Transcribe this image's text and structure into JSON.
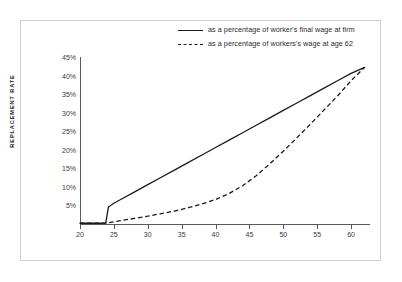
{
  "figure": {
    "background_color": "#ffffff",
    "frame_color": "#cfcfcf",
    "line_color": "#1a1a1a"
  },
  "axis": {
    "y_title": "REPLACEMENT RATE"
  },
  "chart_data": {
    "type": "line",
    "title": "",
    "subtitle": "",
    "xlabel": "",
    "ylabel": "REPLACEMENT RATE",
    "xlim": [
      20,
      62.5
    ],
    "ylim": [
      0,
      45
    ],
    "grid": false,
    "legend_position": "top-right",
    "x_tick_labels": [
      "20",
      "25",
      "30",
      "35",
      "40",
      "45",
      "50",
      "55",
      "60"
    ],
    "x_ticks": [
      20,
      25,
      30,
      35,
      40,
      45,
      50,
      55,
      60
    ],
    "y_tick_labels": [
      "5%",
      "10%",
      "15%",
      "20%",
      "25%",
      "30%",
      "35%",
      "40%",
      "45%"
    ],
    "y_ticks": [
      5,
      10,
      15,
      20,
      25,
      30,
      35,
      40,
      45
    ],
    "series": [
      {
        "name": "as a percentage of worker's final wage at firm",
        "style": "solid",
        "color": "#1a1a1a",
        "x": [
          20,
          21,
          22,
          23,
          23.8,
          24.2,
          25,
          26,
          28,
          30,
          32,
          34,
          36,
          38,
          40,
          42,
          44,
          46,
          48,
          50,
          52,
          54,
          56,
          58,
          60,
          61.5,
          62
        ],
        "y": [
          0.2,
          0.2,
          0.2,
          0.2,
          0.25,
          4.6,
          5.6,
          6.6,
          8.6,
          10.6,
          12.6,
          14.6,
          16.6,
          18.6,
          20.6,
          22.6,
          24.6,
          26.6,
          28.6,
          30.6,
          32.6,
          34.6,
          36.6,
          38.6,
          40.6,
          41.8,
          42.2
        ]
      },
      {
        "name": "as a percentage of workers's wage at age 62",
        "style": "dashed",
        "color": "#1a1a1a",
        "x": [
          20,
          22,
          24,
          25,
          26,
          28,
          30,
          32,
          34,
          36,
          38,
          40,
          42,
          44,
          46,
          48,
          50,
          52,
          54,
          56,
          58,
          60,
          61.5,
          62
        ],
        "y": [
          0.2,
          0.2,
          0.25,
          0.6,
          0.9,
          1.5,
          2.1,
          2.8,
          3.5,
          4.4,
          5.4,
          6.6,
          8.2,
          10.3,
          13.0,
          16.2,
          19.6,
          23.2,
          26.9,
          30.7,
          34.5,
          38.6,
          41.3,
          42.2
        ]
      }
    ]
  },
  "legend": {
    "items": [
      {
        "label": "as a percentage of worker's final wage at firm",
        "style": "solid"
      },
      {
        "label": "as a percentage of workers's wage at age 62",
        "style": "dashed"
      }
    ]
  }
}
